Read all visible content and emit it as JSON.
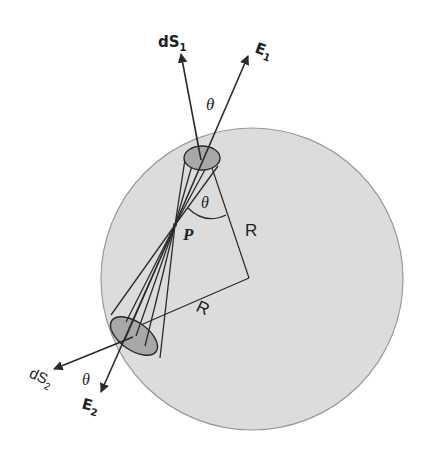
{
  "diagram": {
    "colors": {
      "sphere_fill": "#dcdcdc",
      "sphere_stroke": "#9a9a9a",
      "cap_fill": "#a8a8a8",
      "line": "#2a2a2a",
      "background": "#ffffff"
    },
    "labels": {
      "dS1": "dS",
      "dS1_sub": "1",
      "E1": "E",
      "E1_sub": "1",
      "dS2": "dS",
      "dS2_sub": "2",
      "E2": "E",
      "E2_sub": "2",
      "theta_top": "θ",
      "theta_center": "θ",
      "theta_bottom": "θ",
      "P": "P",
      "R_upper": "R",
      "R_lower": "R"
    },
    "elements": [
      "sphere",
      "point-P",
      "upper-cone-with-cap-dS1",
      "lower-cone-with-cap-dS2",
      "vector-dS1",
      "vector-E1",
      "vector-dS2",
      "vector-E2",
      "radius-line-upper",
      "radius-line-lower",
      "angle-arc-theta"
    ]
  }
}
